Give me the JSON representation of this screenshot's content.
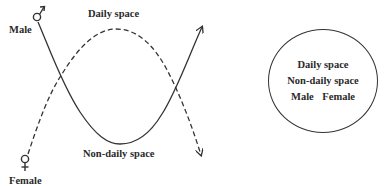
{
  "diagram": {
    "labels": {
      "male": "Male",
      "female": "Female",
      "daily_space": "Daily space",
      "non_daily_space": "Non-daily space"
    },
    "symbols": {
      "male": "male-symbol",
      "female": "female-symbol"
    },
    "curves": [
      {
        "name": "male-path",
        "style": "solid",
        "from": "Male",
        "shape": "dips through Non-daily space, arrow up-right"
      },
      {
        "name": "female-path",
        "style": "dashed",
        "from": "Female",
        "shape": "arches through Daily space, arrow down-right"
      }
    ],
    "legend_circle": {
      "line1": "Daily space",
      "line2": "Non-daily space",
      "line3_a": "Male",
      "line3_b": "Female"
    },
    "colors": {
      "stroke": "#333333",
      "text": "#2a2a2a",
      "background": "#ffffff"
    }
  }
}
